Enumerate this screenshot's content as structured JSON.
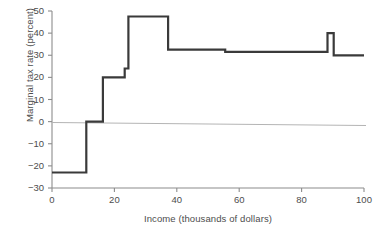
{
  "chart_data": {
    "type": "line",
    "title": "",
    "subtitle": "",
    "xlabel": "Income (thousands of dollars)",
    "ylabel": "Marginal tax rate (percent)",
    "xlim": [
      0,
      100
    ],
    "ylim": [
      -30,
      50
    ],
    "xticks": [
      0,
      20,
      40,
      60,
      80,
      100
    ],
    "yticks": [
      -30,
      -20,
      -10,
      0,
      10,
      20,
      30,
      40,
      50
    ],
    "xtick_labels": [
      "0",
      "20",
      "40",
      "60",
      "80",
      "100"
    ],
    "ytick_labels": [
      "−30",
      "−20",
      "−10",
      "0",
      "10",
      "20",
      "30",
      "40",
      "50"
    ],
    "grid": false,
    "legend": null,
    "legend_position": "none",
    "step_style": "post",
    "series": [
      {
        "name": "Marginal tax rate",
        "color": "#3a3a3a",
        "line_width": 2.2,
        "steps": [
          {
            "x_start": 0,
            "x_end": 11,
            "value": -23
          },
          {
            "x_start": 11,
            "x_end": 16.3,
            "value": 0
          },
          {
            "x_start": 16.3,
            "x_end": 23.3,
            "value": 20
          },
          {
            "x_start": 23.3,
            "x_end": 24.5,
            "value": 24
          },
          {
            "x_start": 24.5,
            "x_end": 37.2,
            "value": 47.5
          },
          {
            "x_start": 37.2,
            "x_end": 55.5,
            "value": 32.5
          },
          {
            "x_start": 55.5,
            "x_end": 88.3,
            "value": 31.5
          },
          {
            "x_start": 88.3,
            "x_end": 90.3,
            "value": 40
          },
          {
            "x_start": 90.3,
            "x_end": 100,
            "value": 30
          }
        ]
      }
    ],
    "reference_line": {
      "name": "zero-line",
      "value": 0,
      "color": "#b4b4b4",
      "line_width": 1
    },
    "annotations": []
  },
  "figure": {
    "caption_fragment": ""
  }
}
